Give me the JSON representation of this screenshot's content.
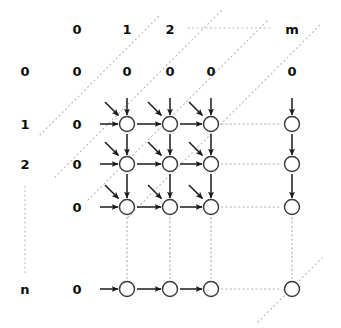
{
  "figure": {
    "kind": "dp-alignment-grid-diagram",
    "colors": {
      "background": "#ffffff",
      "text": "#0d0d0d",
      "arrow": "#1a1a1a",
      "node_stroke": "#3a3a3a",
      "dotted": "#b9b9b9"
    },
    "column_headers": [
      {
        "text": "0",
        "x": 77,
        "y": 29
      },
      {
        "text": "1",
        "x": 127,
        "y": 29
      },
      {
        "text": "2",
        "x": 170,
        "y": 29
      },
      {
        "text": "m",
        "x": 292,
        "y": 29
      }
    ],
    "row_headers": [
      {
        "text": "0",
        "x": 25,
        "y": 71
      },
      {
        "text": "1",
        "x": 25,
        "y": 124
      },
      {
        "text": "2",
        "x": 25,
        "y": 164
      },
      {
        "text": "n",
        "x": 25,
        "y": 289
      }
    ],
    "zero_row": [
      {
        "text": "0",
        "x": 77,
        "y": 71
      },
      {
        "text": "0",
        "x": 127,
        "y": 71
      },
      {
        "text": "0",
        "x": 170,
        "y": 71
      },
      {
        "text": "0",
        "x": 211,
        "y": 71
      },
      {
        "text": "0",
        "x": 292,
        "y": 71
      }
    ],
    "zero_column": [
      {
        "text": "0",
        "x": 77,
        "y": 124
      },
      {
        "text": "0",
        "x": 77,
        "y": 164
      },
      {
        "text": "0",
        "x": 77,
        "y": 207
      },
      {
        "text": "0",
        "x": 77,
        "y": 289
      }
    ],
    "node_radius": 7.5,
    "node_rows_y": [
      124,
      164,
      207,
      289
    ],
    "node_cols_x": [
      127,
      170,
      211,
      292
    ],
    "nodes": [
      {
        "row": 1,
        "col": 1,
        "cx": 127,
        "cy": 124
      },
      {
        "row": 1,
        "col": 2,
        "cx": 170,
        "cy": 124
      },
      {
        "row": 1,
        "col": 3,
        "cx": 211,
        "cy": 124
      },
      {
        "row": 1,
        "col": "m",
        "cx": 292,
        "cy": 124
      },
      {
        "row": 2,
        "col": 1,
        "cx": 127,
        "cy": 164
      },
      {
        "row": 2,
        "col": 2,
        "cx": 170,
        "cy": 164
      },
      {
        "row": 2,
        "col": 3,
        "cx": 211,
        "cy": 164
      },
      {
        "row": 2,
        "col": "m",
        "cx": 292,
        "cy": 164
      },
      {
        "row": 3,
        "col": 1,
        "cx": 127,
        "cy": 207
      },
      {
        "row": 3,
        "col": 2,
        "cx": 170,
        "cy": 207
      },
      {
        "row": 3,
        "col": 3,
        "cx": 211,
        "cy": 207
      },
      {
        "row": 3,
        "col": "m",
        "cx": 292,
        "cy": 207
      },
      {
        "row": "n",
        "col": 1,
        "cx": 127,
        "cy": 289
      },
      {
        "row": "n",
        "col": 2,
        "cx": 170,
        "cy": 289
      },
      {
        "row": "n",
        "col": 3,
        "cx": 211,
        "cy": 289
      },
      {
        "row": "n",
        "col": "m",
        "cx": 292,
        "cy": 289
      }
    ],
    "ellipsis_dotted": {
      "header_row": {
        "x1": 188,
        "y1": 28,
        "x2": 272,
        "y2": 28
      },
      "left_column": {
        "x1": 25,
        "y1": 186,
        "x2": 25,
        "y2": 276
      }
    },
    "legend_note": "solid arrows = DP transitions (diagonal = match/mismatch, vertical = deletion, horizontal = insertion); dotted lines = elided rows/columns and anti-diagonal wavefronts"
  }
}
